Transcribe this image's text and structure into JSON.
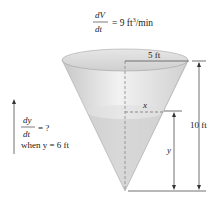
{
  "rate_given": {
    "numerator": "dV",
    "denominator": "dt",
    "value": "= 9 ft",
    "exponent": "3",
    "unit": "/min"
  },
  "rate_unknown": {
    "numerator": "dy",
    "denominator": "dt",
    "value": "= ?",
    "condition": "when y = 6 ft"
  },
  "labels": {
    "radius": "5 ft",
    "height": "10 ft",
    "water_radius": "x",
    "water_height": "y"
  },
  "colors": {
    "cone_fill": "#d9d9d9",
    "water_fill": "#cfcfcf",
    "line": "#333333"
  }
}
